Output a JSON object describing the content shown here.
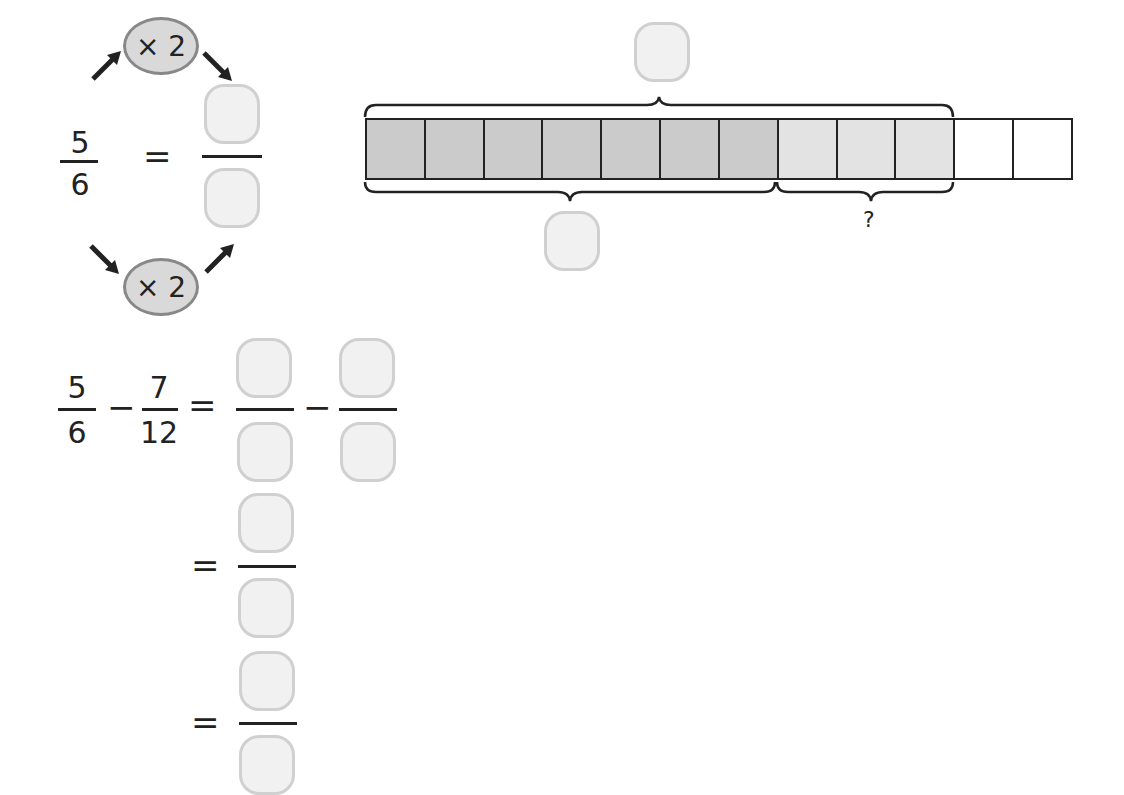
{
  "top_equation": {
    "fraction": {
      "numerator": "5",
      "denominator": "6"
    },
    "equals": "=",
    "multiplier_top": "× 2",
    "multiplier_bottom": "× 2",
    "answer_numerator": "",
    "answer_denominator": ""
  },
  "bar_model": {
    "total_cells": 12,
    "dark_cells": 7,
    "light_cells": 3,
    "white_cells": 2,
    "colors": {
      "dark": "#cbcbcb",
      "light": "#e3e3e3",
      "white": "#ffffff",
      "border": "#222222"
    },
    "top_brace_answer": "",
    "bottom_left_brace_answer": "",
    "bottom_right_brace_label": "?"
  },
  "subtraction": {
    "first_fraction": {
      "numerator": "5",
      "denominator": "6"
    },
    "minus": "−",
    "second_fraction": {
      "numerator": "7",
      "denominator": "12"
    },
    "equals": "=",
    "step1": {
      "left_numerator": "",
      "left_denominator": "",
      "minus": "−",
      "right_numerator": "",
      "right_denominator": ""
    },
    "step2": {
      "equals": "=",
      "numerator": "",
      "denominator": ""
    },
    "step3": {
      "equals": "=",
      "numerator": "",
      "denominator": ""
    }
  }
}
